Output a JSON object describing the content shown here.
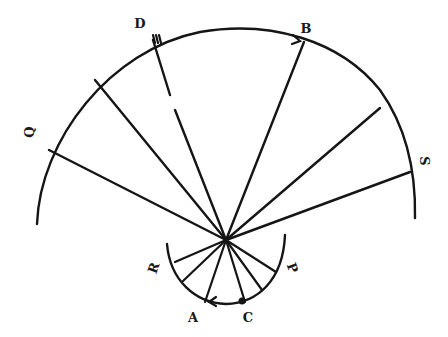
{
  "diagram": {
    "center": {
      "x": 226,
      "y": 240
    },
    "outer_arc": {
      "path": "M 37 224 C 40 140, 110 50, 200 32 C 270 20, 340 40, 380 90 C 405 125, 416 170, 415 218"
    },
    "inner_arc": {
      "path": "M 167 244 C 170 280, 195 303, 226 304 C 258 303, 283 280, 285 235"
    },
    "outer_spokes": [
      {
        "name": "Q",
        "x": 49,
        "y": 150
      },
      {
        "name": "unnamed-left",
        "x": 95,
        "y": 80
      },
      {
        "name": "B",
        "x": 304,
        "y": 42
      },
      {
        "name": "unnamed-right",
        "x": 380,
        "y": 108
      },
      {
        "name": "S",
        "x": 410,
        "y": 172
      }
    ],
    "dashed_spoke": {
      "name": "D",
      "segment1": {
        "x1": 153,
        "y1": 40,
        "x2": 170,
        "y2": 95
      },
      "segment2": {
        "x1": 175,
        "y1": 110,
        "x2": 226,
        "y2": 240
      }
    },
    "inner_spokes": [
      {
        "x": 175,
        "y": 262
      },
      {
        "x": 183,
        "y": 281
      },
      {
        "x": 205,
        "y": 302
      },
      {
        "x": 245,
        "y": 302
      },
      {
        "x": 262,
        "y": 290
      },
      {
        "x": 276,
        "y": 272
      }
    ],
    "arrows": [
      {
        "name": "arrow-at-B",
        "x": 300,
        "y": 41,
        "direction": "right"
      },
      {
        "name": "arrow-at-A",
        "x": 209,
        "y": 302,
        "direction": "left"
      }
    ],
    "markers": [
      {
        "name": "D-hatch-marker",
        "x": 155,
        "y": 39
      },
      {
        "name": "C-dot-marker",
        "x": 242,
        "y": 301
      }
    ],
    "labels": [
      {
        "text": "D",
        "x": 140,
        "y": 28,
        "rotate": 0
      },
      {
        "text": "B",
        "x": 306,
        "y": 33,
        "rotate": 0
      },
      {
        "text": "Q",
        "x": 30,
        "y": 136,
        "rotate": -90
      },
      {
        "text": "S",
        "x": 424,
        "y": 165,
        "rotate": 90
      },
      {
        "text": "R",
        "x": 154,
        "y": 272,
        "rotate": -70
      },
      {
        "text": "P",
        "x": 292,
        "y": 272,
        "rotate": 70
      },
      {
        "text": "A",
        "x": 193,
        "y": 322,
        "rotate": 0
      },
      {
        "text": "C",
        "x": 248,
        "y": 322,
        "rotate": 0
      }
    ]
  }
}
